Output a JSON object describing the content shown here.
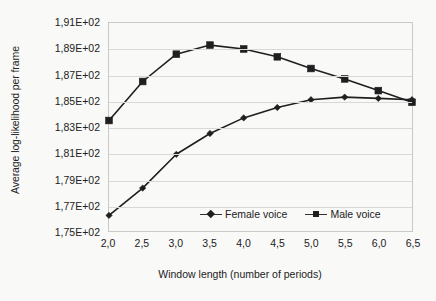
{
  "chart_data": {
    "type": "line",
    "title": "",
    "xlabel": "Window length (number of periods)",
    "ylabel": "Average log-likelihood per frame",
    "x": [
      2.0,
      2.5,
      3.0,
      3.5,
      4.0,
      4.5,
      5.0,
      5.5,
      6.0,
      6.5
    ],
    "xtick_labels": [
      "2,0",
      "2,5",
      "3,0",
      "3,5",
      "4,0",
      "4,5",
      "5,0",
      "5,5",
      "6,0",
      "6,5"
    ],
    "ytick_labels": [
      "1,91E+02",
      "1,89E+02",
      "1,87E+02",
      "1,85E+02",
      "1,83E+02",
      "1,81E+02",
      "1,79E+02",
      "1,77E+02",
      "1,75E+02"
    ],
    "ytick_values": [
      191,
      189,
      187,
      185,
      183,
      181,
      179,
      177,
      175
    ],
    "ylim": [
      175,
      191
    ],
    "xlim": [
      2.0,
      6.5
    ],
    "grid": "horizontal",
    "legend_position": "inside-bottom-center",
    "series": [
      {
        "name": "Female voice",
        "marker": "diamond",
        "color": "#1f1f1f",
        "values": [
          176.2,
          178.3,
          180.9,
          182.5,
          183.7,
          184.5,
          185.1,
          185.3,
          185.2,
          185.1
        ]
      },
      {
        "name": "Male voice",
        "marker": "square",
        "color": "#1f1f1f",
        "values": [
          183.5,
          186.5,
          188.6,
          189.3,
          189.0,
          188.4,
          187.5,
          186.7,
          185.8,
          184.9
        ]
      }
    ]
  }
}
